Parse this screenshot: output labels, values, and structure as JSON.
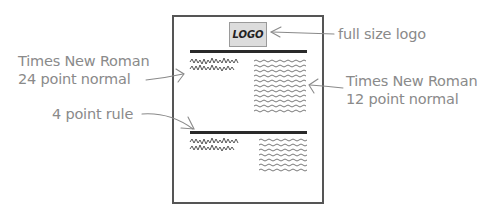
{
  "diagram": {
    "type": "annotated page layout sketch",
    "page": {
      "logo_text": "LOGO",
      "sections": [
        {
          "headline": "scribbled 24pt headline (2 lines)",
          "body": "scribbled 12pt body text column"
        },
        {
          "headline": "scribbled 24pt headline (2 lines)",
          "body": "scribbled 12pt body text column"
        }
      ]
    },
    "annotations": {
      "headline_font": {
        "line1": "Times New Roman",
        "line2": "24 point normal"
      },
      "logo": {
        "text": "full size logo"
      },
      "body_font": {
        "line1": "Times New Roman",
        "line2": "12 point normal"
      },
      "rule": {
        "text": "4 point rule"
      }
    },
    "colors": {
      "annotation_text": "#8a8a8a",
      "page_border": "#555555",
      "rule": "#2a2a2a",
      "logo_fill": "#dcdcdc",
      "scribble": "#444444"
    }
  }
}
